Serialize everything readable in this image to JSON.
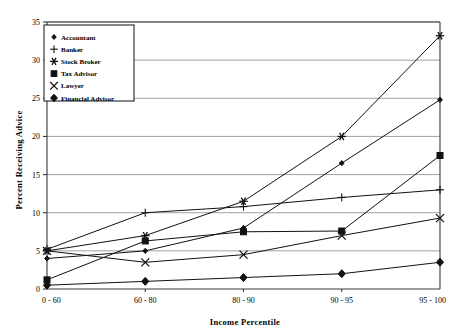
{
  "chart_data": {
    "type": "line",
    "title": "",
    "xlabel": "Income Percentile",
    "ylabel": "Percent Receiving Advice",
    "categories": [
      "0 - 60",
      "60 - 80",
      "80 - 90",
      "90 - 95",
      "95 - 100"
    ],
    "ylim": [
      0,
      35
    ],
    "yticks": [
      0,
      5,
      10,
      15,
      20,
      25,
      30,
      35
    ],
    "ytick_labels": [
      "0",
      "5",
      "10",
      "15",
      "20",
      "25",
      "30",
      "35"
    ],
    "grid": true,
    "legend_position": "top-left",
    "series": [
      {
        "name": "Accountant",
        "marker": "small-diamond",
        "values": [
          4.0,
          5.0,
          8.0,
          16.5,
          24.8
        ]
      },
      {
        "name": "Banker",
        "marker": "plus",
        "values": [
          5.2,
          10.0,
          10.8,
          12.0,
          13.0
        ]
      },
      {
        "name": "Stock Broker",
        "marker": "asterisk",
        "values": [
          5.0,
          7.0,
          11.5,
          20.0,
          33.2
        ]
      },
      {
        "name": "Tax Advisor",
        "marker": "filled-square",
        "values": [
          1.2,
          6.3,
          7.5,
          7.6,
          17.5
        ]
      },
      {
        "name": "Lawyer",
        "marker": "x-cross",
        "values": [
          5.0,
          3.5,
          4.5,
          7.0,
          9.3
        ]
      },
      {
        "name": "Financial Advisor",
        "marker": "filled-diamond",
        "values": [
          0.5,
          1.0,
          1.5,
          2.0,
          3.5
        ]
      }
    ]
  },
  "legend": {
    "items": [
      {
        "label": "Accountant",
        "marker": "small-diamond"
      },
      {
        "label": "Banker",
        "marker": "plus"
      },
      {
        "label": "Stock Broker",
        "marker": "asterisk"
      },
      {
        "label": "Tax Advisor",
        "marker": "filled-square"
      },
      {
        "label": "Lawyer",
        "marker": "x-cross"
      },
      {
        "label": "Financial Advisor",
        "marker": "filled-diamond"
      }
    ]
  }
}
